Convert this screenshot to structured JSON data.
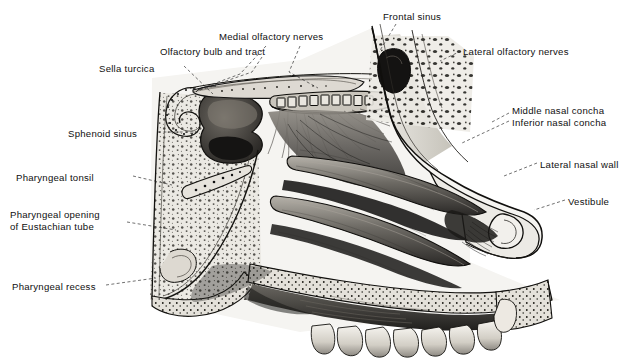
{
  "figure": {
    "type": "anatomical-illustration",
    "medium": "halftone engraving",
    "background_color": "#ffffff",
    "ink_color": "#101010",
    "palette": {
      "bone_light": "#e8e6e0",
      "bone_mid": "#c9c6bd",
      "mucosa_mid": "#9a968e",
      "mucosa_dark": "#4e4b46",
      "cavity_dark": "#22201e",
      "shadow_black": "#0d0c0b",
      "highlight": "#f6f5f2"
    }
  },
  "labels": [
    {
      "id": "frontal-sinus",
      "text": "Frontal sinus",
      "lines": [
        "Frontal sinus"
      ],
      "x": 383,
      "y": 11,
      "align": "left"
    },
    {
      "id": "medial-olfactory",
      "text": "Medial olfactory nerves",
      "lines": [
        "Medial olfactory nerves"
      ],
      "x": 219,
      "y": 31,
      "align": "left"
    },
    {
      "id": "lateral-olfactory",
      "text": "Lateral olfactory nerves",
      "lines": [
        "Lateral olfactory nerves"
      ],
      "x": 463,
      "y": 46,
      "align": "left"
    },
    {
      "id": "olfactory-bulb",
      "text": "Olfactory bulb and tract",
      "lines": [
        "Olfactory bulb and tract"
      ],
      "x": 160,
      "y": 46,
      "align": "left"
    },
    {
      "id": "sella-turcica",
      "text": "Sella turcica",
      "lines": [
        "Sella turcica"
      ],
      "x": 99,
      "y": 63,
      "align": "left"
    },
    {
      "id": "middle-concha",
      "text": "Middle nasal concha",
      "lines": [
        "Middle nasal concha"
      ],
      "x": 512,
      "y": 105,
      "align": "left"
    },
    {
      "id": "inferior-concha",
      "text": "Inferior nasal concha",
      "lines": [
        "Inferior nasal concha"
      ],
      "x": 512,
      "y": 117,
      "align": "left"
    },
    {
      "id": "sphenoid-sinus",
      "text": "Sphenoid sinus",
      "lines": [
        "Sphenoid sinus"
      ],
      "x": 68,
      "y": 128,
      "align": "left"
    },
    {
      "id": "lateral-nasal-wall",
      "text": "Lateral nasal wall",
      "lines": [
        "Lateral nasal wall"
      ],
      "x": 540,
      "y": 159,
      "align": "left"
    },
    {
      "id": "pharyngeal-tonsil",
      "text": "Pharyngeal tonsil",
      "lines": [
        "Pharyngeal tonsil"
      ],
      "x": 16,
      "y": 172,
      "align": "left"
    },
    {
      "id": "vestibule",
      "text": "Vestibule",
      "lines": [
        "Vestibule"
      ],
      "x": 568,
      "y": 196,
      "align": "left"
    },
    {
      "id": "eustachian-opening",
      "text": "Pharyngeal opening of Eustachian tube",
      "lines": [
        "Pharyngeal opening",
        "of Eustachian tube"
      ],
      "x": 10,
      "y": 209,
      "align": "left"
    },
    {
      "id": "pharyngeal-recess",
      "text": "Pharyngeal recess",
      "lines": [
        "Pharyngeal recess"
      ],
      "x": 12,
      "y": 281,
      "align": "left"
    }
  ],
  "leaders": [
    {
      "id": "leader-frontal-sinus",
      "for": "frontal-sinus",
      "points": "396,24 379,52"
    },
    {
      "id": "leader-medial-olf-a",
      "for": "medial-olfactory",
      "points": "266,46 240,74 205,87"
    },
    {
      "id": "leader-medial-olf-b",
      "for": "medial-olfactory",
      "points": "300,46 289,72 318,88"
    },
    {
      "id": "leader-lateral-olf",
      "for": "lateral-olfactory",
      "points": "461,51 440,61"
    },
    {
      "id": "leader-olfactory-bulb",
      "for": "olfactory-bulb",
      "points": "264,58 265,67"
    },
    {
      "id": "leader-sella-turcica",
      "for": "sella-turcica",
      "points": "184,66 213,94"
    },
    {
      "id": "leader-concha",
      "for": "middle-concha",
      "points": "509,117 494,125"
    },
    {
      "id": "leader-concha-2",
      "for": "inferior-concha",
      "points": "509,122 470,140"
    },
    {
      "id": "leader-sphenoid-sinus",
      "for": "sphenoid-sinus",
      "points": "158,132 196,132"
    },
    {
      "id": "leader-lateral-wall",
      "for": "lateral-nasal-wall",
      "points": "537,163 505,175"
    },
    {
      "id": "leader-pharyngeal-tonsil",
      "for": "pharyngeal-tonsil",
      "points": "133,176 168,183"
    },
    {
      "id": "leader-vestibule",
      "for": "vestibule",
      "points": "565,200 540,209"
    },
    {
      "id": "leader-eustachian",
      "for": "eustachian-opening",
      "points": "127,222 168,228"
    },
    {
      "id": "leader-pharyngeal-recess",
      "for": "pharyngeal-recess",
      "points": "106,285 152,279"
    }
  ]
}
